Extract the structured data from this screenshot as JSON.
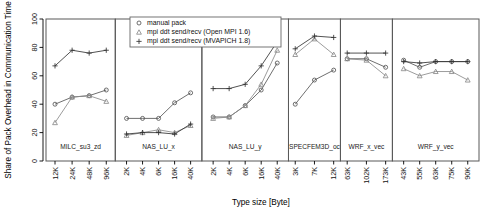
{
  "chart_data": {
    "type": "line",
    "title": "",
    "xlabel": "Type size [Byte]",
    "ylabel": "Share of Pack Overhead in Communication Time",
    "ylim": [
      0,
      100
    ],
    "yticks": [
      0,
      20,
      40,
      60,
      80,
      100
    ],
    "grid": false,
    "legend_position": "top-center",
    "legend": [
      {
        "label": "manual pack",
        "symbol": "circle",
        "color": "#555555"
      },
      {
        "label": "mpi ddt send/recv (Open MPI 1.6)",
        "symbol": "triangle",
        "color": "#8a8a8a"
      },
      {
        "label": "mpi ddt send/recv (MVAPICH 1.8)",
        "symbol": "plus",
        "color": "#333333"
      }
    ],
    "panels": [
      {
        "name": "MILC_su3_zd",
        "categories": [
          "12K",
          "24K",
          "48K",
          "96K"
        ],
        "series": [
          {
            "name": "manual pack",
            "values": [
              40,
              45,
              46,
              50
            ]
          },
          {
            "name": "mpi ddt send/recv (Open MPI 1.6)",
            "values": [
              27,
              45,
              46,
              42
            ]
          },
          {
            "name": "mpi ddt send/recv (MVAPICH 1.8)",
            "values": [
              67,
              78,
              76,
              78
            ]
          }
        ]
      },
      {
        "name": "NAS_LU_x",
        "categories": [
          "2K",
          "4K",
          "6K",
          "16K",
          "40K"
        ],
        "series": [
          {
            "name": "manual pack",
            "values": [
              30,
              30,
              30,
              41,
              48
            ]
          },
          {
            "name": "mpi ddt send/recv (Open MPI 1.6)",
            "values": [
              18,
              20,
              22,
              20,
              25
            ]
          },
          {
            "name": "mpi ddt send/recv (MVAPICH 1.8)",
            "values": [
              19,
              20,
              20,
              19,
              26
            ]
          }
        ]
      },
      {
        "name": "NAS_LU_y",
        "categories": [
          "2K",
          "4K",
          "6K",
          "16K",
          "40K"
        ],
        "series": [
          {
            "name": "manual pack",
            "values": [
              31,
              31,
              39,
              50,
              69
            ]
          },
          {
            "name": "mpi ddt send/recv (Open MPI 1.6)",
            "values": [
              30,
              31,
              39,
              54,
              78
            ]
          },
          {
            "name": "mpi ddt send/recv (MVAPICH 1.8)",
            "values": [
              51,
              51,
              54,
              67,
              84
            ]
          }
        ]
      },
      {
        "name": "SPECFEM3D_oc",
        "categories": [
          "3K",
          "7K",
          "12K"
        ],
        "series": [
          {
            "name": "manual pack",
            "values": [
              40,
              57,
              64
            ]
          },
          {
            "name": "mpi ddt send/recv (Open MPI 1.6)",
            "values": [
              75,
              86,
              75
            ]
          },
          {
            "name": "mpi ddt send/recv (MVAPICH 1.8)",
            "values": [
              79,
              88,
              87
            ]
          }
        ]
      },
      {
        "name": "WRF_x_vec",
        "categories": [
          "63K",
          "102K",
          "173K"
        ],
        "series": [
          {
            "name": "manual pack",
            "values": [
              72,
              72,
              66
            ]
          },
          {
            "name": "mpi ddt send/recv (Open MPI 1.6)",
            "values": [
              72,
              71,
              60
            ]
          },
          {
            "name": "mpi ddt send/recv (MVAPICH 1.8)",
            "values": [
              76,
              76,
              76
            ]
          }
        ]
      },
      {
        "name": "WRF_y_vec",
        "categories": [
          "43K",
          "55K",
          "63K",
          "75K",
          "90K"
        ],
        "series": [
          {
            "name": "manual pack",
            "values": [
              71,
              66,
              70,
              70,
              70
            ]
          },
          {
            "name": "mpi ddt send/recv (Open MPI 1.6)",
            "values": [
              65,
              60,
              63,
              63,
              57
            ]
          },
          {
            "name": "mpi ddt send/recv (MVAPICH 1.8)",
            "values": [
              70,
              69,
              70,
              70,
              70
            ]
          }
        ]
      }
    ]
  }
}
